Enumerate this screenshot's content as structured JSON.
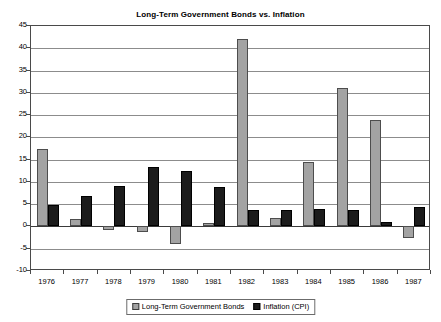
{
  "chart_data": {
    "type": "bar",
    "title": "Long-Term Government Bonds vs. Inflation",
    "xlabel": "",
    "ylabel": "",
    "categories": [
      "1976",
      "1977",
      "1978",
      "1979",
      "1980",
      "1981",
      "1982",
      "1983",
      "1984",
      "1985",
      "1986",
      "1987"
    ],
    "series": [
      {
        "name": "Long-Term Government Bonds",
        "color": "#a3a3a3",
        "values": [
          17.5,
          1.7,
          -0.7,
          -1.2,
          -3.9,
          0.7,
          42.0,
          1.8,
          14.5,
          31.0,
          24.0,
          -2.7
        ]
      },
      {
        "name": "Inflation (CPI)",
        "color": "#1c1c1c",
        "values": [
          4.8,
          6.8,
          9.0,
          13.3,
          12.4,
          8.9,
          3.8,
          3.8,
          3.9,
          3.8,
          1.1,
          4.4
        ]
      }
    ],
    "ylim": [
      -10,
      45
    ],
    "ytick_values": [
      45,
      40,
      35,
      30,
      25,
      20,
      15,
      10,
      5,
      0,
      -5,
      -10
    ],
    "ytick_labels": [
      "45",
      "40",
      "35",
      "30",
      "25",
      "20",
      "15",
      "10",
      "5",
      "0",
      "-5",
      "-10"
    ],
    "grid": true,
    "legend_position": "bottom",
    "legend_entries": [
      "Long-Term Government Bonds",
      "Inflation (CPI)"
    ]
  }
}
